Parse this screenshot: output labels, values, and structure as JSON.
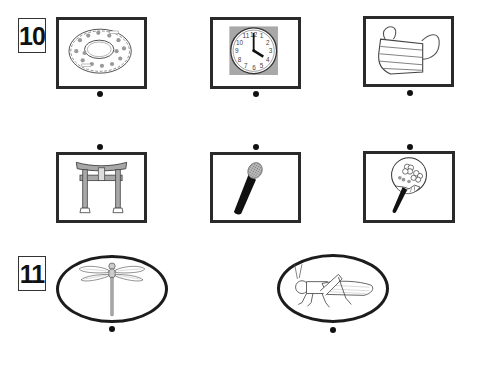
{
  "questions": [
    {
      "number": "10",
      "items": [
        {
          "id": "donut",
          "label": "donut"
        },
        {
          "id": "clock",
          "label": "clock showing 4 o'clock"
        },
        {
          "id": "mask",
          "label": "face mask"
        },
        {
          "id": "torii",
          "label": "torii gate"
        },
        {
          "id": "microphone",
          "label": "microphone"
        },
        {
          "id": "uchiwa",
          "label": "uchiwa fan"
        }
      ]
    },
    {
      "number": "11",
      "items": [
        {
          "id": "dragonfly",
          "label": "dragonfly"
        },
        {
          "id": "grasshopper",
          "label": "grasshopper"
        }
      ]
    }
  ],
  "clock_numerals": [
    "12",
    "1",
    "2",
    "3",
    "4",
    "5",
    "6",
    "7",
    "8",
    "9",
    "10",
    "11"
  ],
  "colors": {
    "border": "#2a2a2a",
    "gray_fill": "#a8a8a8",
    "dot": "#111111"
  }
}
